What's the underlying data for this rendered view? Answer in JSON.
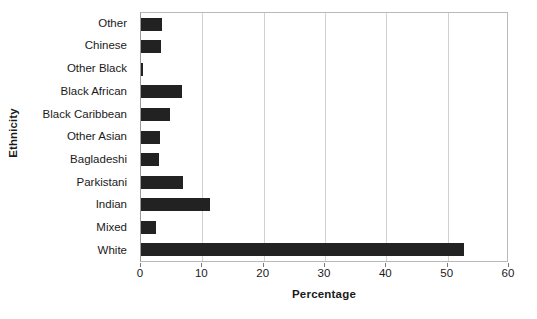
{
  "chart_data": {
    "type": "bar",
    "orientation": "horizontal",
    "title": "",
    "xlabel": "Percentage",
    "ylabel": "Ethnicity",
    "xlim": [
      0,
      60
    ],
    "xticks": [
      0,
      10,
      20,
      30,
      40,
      50,
      60
    ],
    "xtick_labels": [
      "0",
      "10",
      "20",
      "30",
      "40",
      "50",
      "60"
    ],
    "grid": "vertical",
    "legend": "none",
    "bar_color": "#222222",
    "categories": [
      "Other",
      "Chinese",
      "Other Black",
      "Black African",
      "Black Caribbean",
      "Other Asian",
      "Bagladeshi",
      "Parkistani",
      "Indian",
      "Mixed",
      "White"
    ],
    "values": [
      3.5,
      3.2,
      0.4,
      6.7,
      4.7,
      3.1,
      2.9,
      6.8,
      11.2,
      2.4,
      52.6
    ]
  }
}
